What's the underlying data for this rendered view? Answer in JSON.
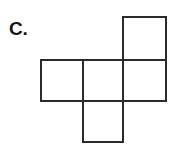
{
  "figure": {
    "label": "C.",
    "kind": "cube-net",
    "background_color": "#ffffff",
    "stroke_color": "#2b2b2b",
    "fill_color": "#ffffff",
    "stroke_width": 2,
    "canvas": {
      "width": 173,
      "height": 150
    },
    "cell_size": 42,
    "squares": [
      {
        "name": "top-right-square",
        "x": 123,
        "y": 17,
        "w": 43,
        "h": 43,
        "row": 0,
        "col": 2
      },
      {
        "name": "middle-left-square",
        "x": 41,
        "y": 60,
        "w": 42,
        "h": 41,
        "row": 1,
        "col": 0
      },
      {
        "name": "middle-center-square",
        "x": 83,
        "y": 60,
        "w": 40,
        "h": 41,
        "row": 1,
        "col": 1
      },
      {
        "name": "middle-right-square",
        "x": 123,
        "y": 60,
        "w": 43,
        "h": 41,
        "row": 1,
        "col": 2
      },
      {
        "name": "bottom-center-square",
        "x": 83,
        "y": 101,
        "w": 40,
        "h": 41,
        "row": 2,
        "col": 1
      }
    ]
  }
}
